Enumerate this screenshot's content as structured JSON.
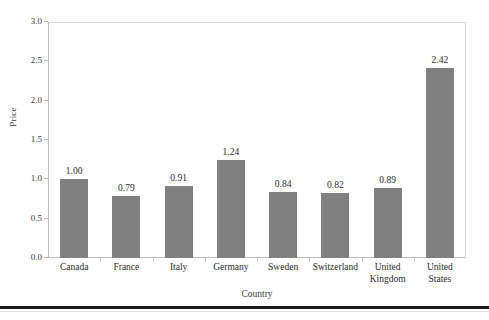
{
  "chart_data": {
    "type": "bar",
    "title": "",
    "xlabel": "Country",
    "ylabel": "Price",
    "categories": [
      "Canada",
      "France",
      "Italy",
      "Germany",
      "Sweden",
      "Switzerland",
      "United Kingdom",
      "United States"
    ],
    "category_lines": [
      [
        "Canada"
      ],
      [
        "France"
      ],
      [
        "Italy"
      ],
      [
        "Germany"
      ],
      [
        "Sweden"
      ],
      [
        "Switzerland"
      ],
      [
        "United",
        "Kingdom"
      ],
      [
        "United",
        "States"
      ]
    ],
    "values": [
      1.0,
      0.79,
      0.91,
      1.24,
      0.84,
      0.82,
      0.89,
      2.42
    ],
    "value_labels": [
      "1.00",
      "0.79",
      "0.91",
      "1.24",
      "0.84",
      "0.82",
      "0.89",
      "2.42"
    ],
    "ylim": [
      0.0,
      3.0
    ],
    "ytick_labels": [
      "3.0",
      "2.5",
      "2.0",
      "1.5",
      "1.0",
      "0.5",
      "0.0"
    ],
    "ytick_values": [
      3.0,
      2.5,
      2.0,
      1.5,
      1.0,
      0.5,
      0.0
    ],
    "grid": false,
    "legend": null,
    "bar_color": "#808080",
    "frame_color": "#d9d9d9",
    "text_color": "#2b2b2b"
  }
}
